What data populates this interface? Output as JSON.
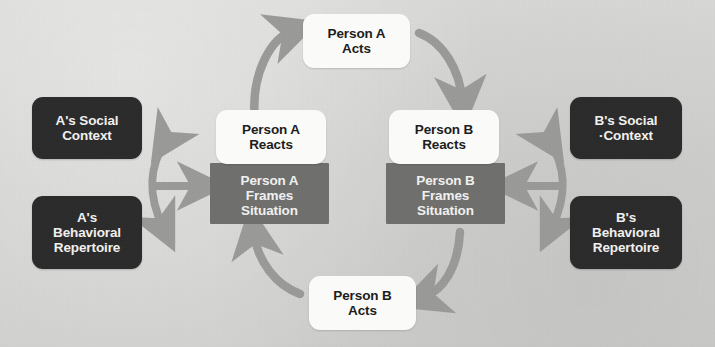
{
  "diagram": {
    "background_color": "#d6d6d4",
    "colors": {
      "dark_node": "#2c2b2b",
      "gray_node": "#6f6f6e",
      "white_node": "#fafaf8",
      "arrow": "#9a9a98",
      "dark_node_text": "#f2f2f0",
      "gray_node_text": "#f0f0ee",
      "white_node_text": "#1d1d1d"
    },
    "nodes": {
      "a_social_context": "A's Social\nContext",
      "a_behavioral_repertoire": "A's\nBehavioral\nRepertoire",
      "b_social_context": "B's Social\n·Context",
      "b_behavioral_repertoire": "B's\nBehavioral\nRepertoire",
      "person_a_reacts": "Person A\nReacts",
      "person_b_reacts": "Person B\nReacts",
      "person_a_frames_situation": "Person A\nFrames\nSituation",
      "person_b_frames_situation": "Person B\nFrames\nSituation",
      "person_a_acts": "Person A\nActs",
      "person_b_acts": "Person B\nActs"
    },
    "connections": [
      {
        "name": "a-reacts-to-a-acts",
        "from": "person_a_reacts",
        "to": "person_a_acts",
        "style": "curved",
        "heads": 1
      },
      {
        "name": "a-acts-to-b-reacts",
        "from": "person_a_acts",
        "to": "person_b_reacts",
        "style": "curved",
        "heads": 1
      },
      {
        "name": "b-frames-to-b-acts",
        "from": "person_b_frames_situation",
        "to": "person_b_acts",
        "style": "curved",
        "heads": 1
      },
      {
        "name": "b-acts-to-a-frames",
        "from": "person_b_acts",
        "to": "person_a_frames_situation",
        "style": "curved",
        "heads": 1
      },
      {
        "name": "a-context-repertoire-link",
        "from": "a_social_context",
        "to": "a_behavioral_repertoire",
        "style": "curved",
        "heads": 2
      },
      {
        "name": "b-context-repertoire-link",
        "from": "b_social_context",
        "to": "b_behavioral_repertoire",
        "style": "curved",
        "heads": 2
      },
      {
        "name": "a-context-to-a-frames",
        "from": "a_context_hub",
        "to": "person_a_frames_situation",
        "style": "straight",
        "heads": 1
      },
      {
        "name": "b-context-to-b-frames",
        "from": "b_context_hub",
        "to": "person_b_frames_situation",
        "style": "straight",
        "heads": 1
      }
    ]
  }
}
